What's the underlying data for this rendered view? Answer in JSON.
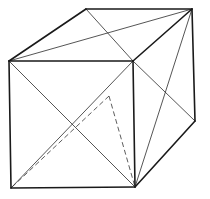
{
  "figure": {
    "width": 210,
    "height": 199,
    "background": "#ffffff",
    "line_color": "#1a1a1a"
  },
  "vertices": {
    "top_front_left": [
      9,
      61
    ],
    "top_back_left": [
      86,
      9
    ],
    "top_back_right": [
      192,
      9
    ],
    "top_front_right": [
      133,
      61
    ],
    "bottom_front_left": [
      11,
      188
    ],
    "bottom_front_right": [
      135,
      187
    ],
    "bottom_back_right": [
      195,
      121
    ],
    "hidden_vertex": [
      109,
      96
    ]
  },
  "edges": [
    {
      "from": "top_front_left",
      "to": "top_back_left",
      "style": "solid"
    },
    {
      "from": "top_back_left",
      "to": "top_back_right",
      "style": "solid"
    },
    {
      "from": "top_back_right",
      "to": "top_front_right",
      "style": "solid"
    },
    {
      "from": "top_front_right",
      "to": "top_front_left",
      "style": "solid"
    },
    {
      "from": "top_front_left",
      "to": "bottom_front_left",
      "style": "solid"
    },
    {
      "from": "bottom_front_left",
      "to": "bottom_front_right",
      "style": "solid"
    },
    {
      "from": "bottom_front_right",
      "to": "top_front_right",
      "style": "solid"
    },
    {
      "from": "top_back_right",
      "to": "bottom_back_right",
      "style": "solid"
    },
    {
      "from": "bottom_back_right",
      "to": "bottom_front_right",
      "style": "solid"
    }
  ],
  "diagonals": [
    {
      "from": "top_front_left",
      "to": "top_back_right",
      "face": "top"
    },
    {
      "from": "top_back_left",
      "to": "top_front_right",
      "face": "top"
    },
    {
      "from": "top_front_left",
      "to": "bottom_front_right",
      "face": "front"
    },
    {
      "from": "top_front_right",
      "to": "bottom_front_left",
      "face": "front"
    },
    {
      "from": "top_front_right",
      "to": "bottom_back_right",
      "face": "right"
    },
    {
      "from": "top_back_right",
      "to": "bottom_front_right",
      "face": "right"
    }
  ],
  "hidden_lines": [
    {
      "from": "hidden_vertex",
      "to": "bottom_front_left",
      "style": "dashed"
    },
    {
      "from": "hidden_vertex",
      "to": "bottom_front_right",
      "style": "dashed"
    }
  ]
}
